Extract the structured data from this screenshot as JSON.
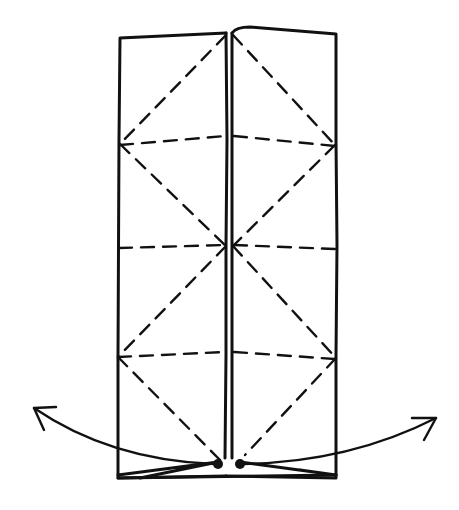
{
  "diagram": {
    "type": "origami-fold-diagram",
    "colors": {
      "ink": "#111111",
      "paper": "#ffffff"
    },
    "outline": {
      "left_panel": {
        "x1": 118,
        "x2": 226,
        "top": 35,
        "bottom": 478
      },
      "right_panel": {
        "x1": 232,
        "x2": 336,
        "top": 30,
        "bottom": 478
      }
    },
    "horizontal_folds_y": [
      142,
      245,
      355
    ],
    "reference_points": [
      {
        "name": "left-dot",
        "x": 218,
        "y": 464
      },
      {
        "name": "right-dot",
        "x": 240,
        "y": 464
      }
    ],
    "arrows": [
      {
        "name": "left-pull-arrow",
        "direction": "outward-left",
        "tip": {
          "x": 33,
          "y": 408
        }
      },
      {
        "name": "right-pull-arrow",
        "direction": "outward-right",
        "tip": {
          "x": 437,
          "y": 418
        }
      }
    ],
    "labels": []
  }
}
